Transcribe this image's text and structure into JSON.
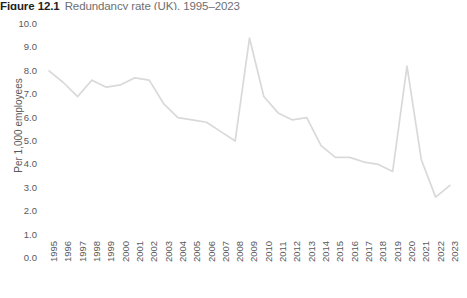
{
  "figure": {
    "number": "Figure 12.1",
    "caption": "Redundancy rate (UK), 1995–2023"
  },
  "axes": {
    "y_title": "Per 1,000 employees",
    "y_ticks": [
      "10.0",
      "9.0",
      "8.0",
      "7.0",
      "6.0",
      "5.0",
      "4.0",
      "3.0",
      "2.0",
      "1.0",
      "0.0"
    ]
  },
  "style": {
    "line_color": "#d9d9d9",
    "text_color": "#58595b",
    "title_color": "#231f20",
    "caption_color": "#6d6e71",
    "background": "#ffffff"
  },
  "chart_data": {
    "type": "line",
    "title": "Redundancy rate (UK), 1995–2023",
    "xlabel": "",
    "ylabel": "Per 1,000 employees",
    "ylim": [
      0,
      10
    ],
    "ytick_step": 1.0,
    "grid": false,
    "legend": "none",
    "categories": [
      "1995",
      "1996",
      "1997",
      "1998",
      "1999",
      "2000",
      "2001",
      "2002",
      "2003",
      "2004",
      "2005",
      "2006",
      "2007",
      "2008",
      "2009",
      "2010",
      "2011",
      "2012",
      "2013",
      "2014",
      "2015",
      "2016",
      "2017",
      "2018",
      "2019",
      "2020",
      "2021",
      "2022",
      "2023"
    ],
    "values": [
      8.0,
      7.5,
      6.9,
      7.6,
      7.3,
      7.4,
      7.7,
      7.6,
      6.6,
      6.0,
      5.9,
      5.8,
      5.4,
      5.0,
      9.4,
      6.9,
      6.2,
      5.9,
      6.0,
      4.8,
      4.3,
      4.3,
      4.1,
      4.0,
      3.7,
      8.2,
      4.2,
      2.6,
      3.1
    ]
  }
}
